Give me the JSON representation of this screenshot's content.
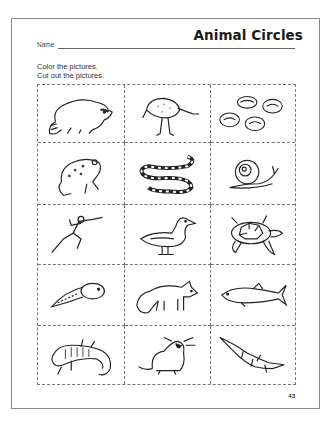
{
  "worksheet": {
    "title": "Animal Circles",
    "name_label": "Name",
    "instructions": [
      "Color the pictures.",
      "Cut out the pictures."
    ],
    "page_number": "43"
  },
  "grid": {
    "rows": 5,
    "columns": 3,
    "cells": [
      {
        "animal": "raccoon",
        "icon": "raccoon-icon"
      },
      {
        "animal": "emu",
        "icon": "emu-icon"
      },
      {
        "animal": "clams",
        "icon": "clams-icon"
      },
      {
        "animal": "frog",
        "icon": "frog-icon"
      },
      {
        "animal": "snake",
        "icon": "snake-icon"
      },
      {
        "animal": "snail",
        "icon": "snail-icon"
      },
      {
        "animal": "human runner",
        "icon": "runner-icon"
      },
      {
        "animal": "duck",
        "icon": "duck-icon"
      },
      {
        "animal": "sea turtle",
        "icon": "turtle-icon"
      },
      {
        "animal": "tadpole",
        "icon": "tadpole-icon"
      },
      {
        "animal": "fox",
        "icon": "fox-icon"
      },
      {
        "animal": "fish",
        "icon": "fish-icon"
      },
      {
        "animal": "salamander",
        "icon": "salamander-icon"
      },
      {
        "animal": "mole",
        "icon": "mole-icon"
      },
      {
        "animal": "alligator",
        "icon": "alligator-icon"
      }
    ]
  },
  "colors": {
    "border": "#8a8a8a",
    "dashed_line": "#777777",
    "ink": "#222222"
  }
}
